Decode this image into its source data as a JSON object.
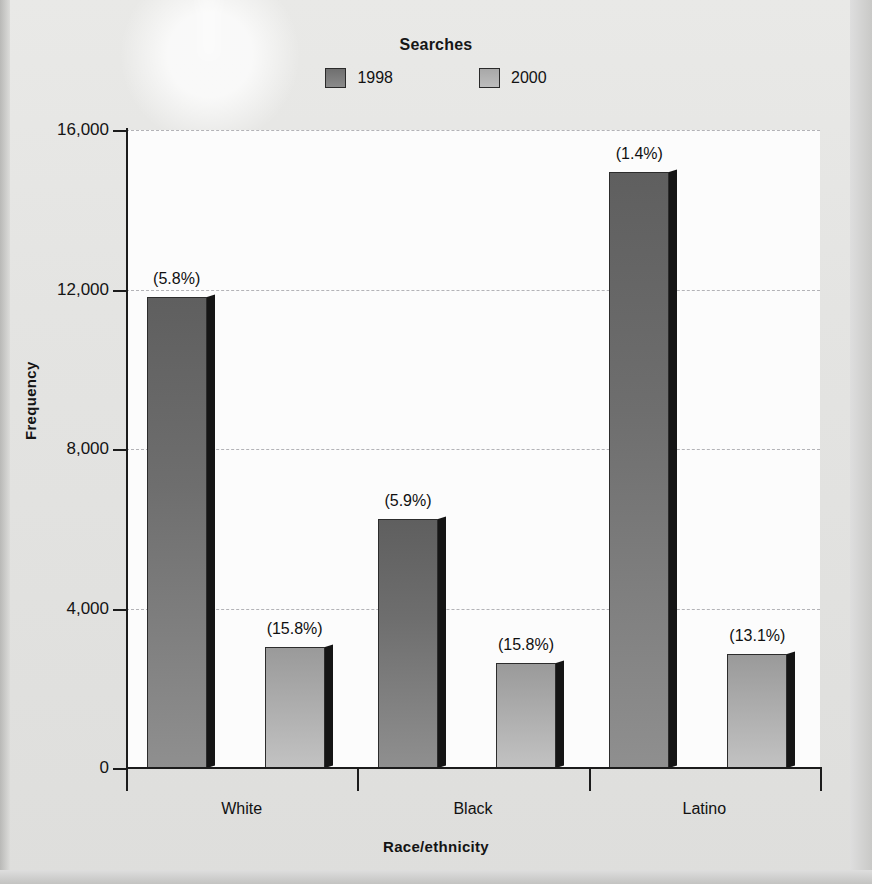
{
  "chart_data": {
    "type": "bar",
    "title": "Searches",
    "xlabel": "Race/ethnicity",
    "ylabel": "Frequency",
    "categories": [
      "White",
      "Black",
      "Latino"
    ],
    "ylim": [
      0,
      16000
    ],
    "yticks": [
      0,
      4000,
      8000,
      12000,
      16000
    ],
    "ytick_labels": [
      "0",
      "4,000",
      "8,000",
      "12,000",
      "16,000"
    ],
    "grid": true,
    "legend_position": "top",
    "series": [
      {
        "name": "1998",
        "color": "#6e6e6e",
        "values": [
          11800,
          6250,
          14950
        ],
        "annotations": [
          "(5.8%)",
          "(5.9%)",
          "(1.4%)"
        ]
      },
      {
        "name": "2000",
        "color": "#b0b0b0",
        "values": [
          3030,
          2640,
          2870
        ],
        "annotations": [
          "(15.8%)",
          "(15.8%)",
          "(13.1%)"
        ]
      }
    ]
  },
  "legend": {
    "title": "Searches",
    "items": [
      {
        "label": "1998",
        "swatch": "swatch-1998"
      },
      {
        "label": "2000",
        "swatch": "swatch-2000"
      }
    ]
  },
  "axes": {
    "y_title": "Frequency",
    "x_title": "Race/ethnicity"
  }
}
